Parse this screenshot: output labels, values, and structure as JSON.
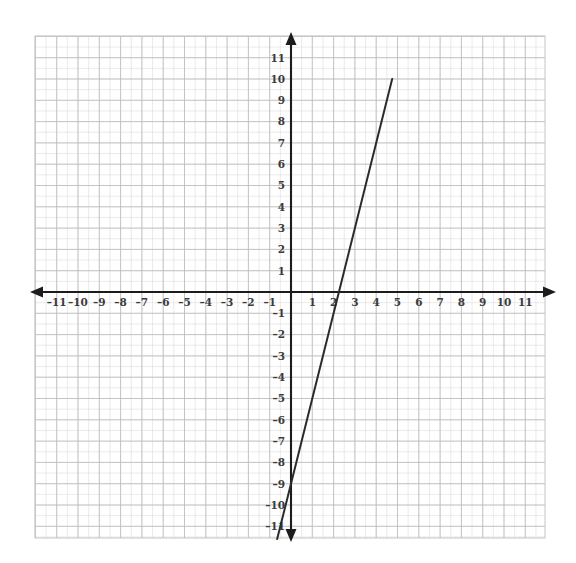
{
  "chart_data": {
    "type": "line",
    "title": "",
    "xlabel": "",
    "ylabel": "",
    "xlim": [
      -11.8,
      11.9
    ],
    "ylim": [
      -11.9,
      11.6
    ],
    "grid": true,
    "legend": false,
    "grid_minor_step": 0.5,
    "grid_major_step": 1,
    "x_ticks": [
      -11,
      -10,
      -9,
      -8,
      -7,
      -6,
      -5,
      -4,
      -3,
      -2,
      -1,
      1,
      2,
      3,
      4,
      5,
      6,
      7,
      8,
      9,
      10,
      11
    ],
    "y_ticks": [
      11,
      10,
      9,
      8,
      7,
      6,
      5,
      4,
      3,
      2,
      1,
      -1,
      -2,
      -3,
      -4,
      -5,
      -6,
      -7,
      -8,
      -9,
      -10,
      -11
    ],
    "x_tick_labels": [
      "–11",
      "–10",
      "–9",
      "–8",
      "–7",
      "–6",
      "–5",
      "–4",
      "–3",
      "–2",
      "–1",
      "1",
      "2",
      "3",
      "4",
      "5",
      "6",
      "7",
      "8",
      "9",
      "10",
      "11"
    ],
    "y_tick_labels": [
      "11",
      "10",
      "9",
      "8",
      "7",
      "6",
      "5",
      "4",
      "3",
      "2",
      "1",
      "–1",
      "–2",
      "–3",
      "–4",
      "–5",
      "–6",
      "–7",
      "–8",
      "–9",
      "–10",
      "–11"
    ],
    "series": [
      {
        "name": "line",
        "slope": 4,
        "intercept": -9,
        "x_intercept": 2.25,
        "points": [
          {
            "x": -0.65,
            "y": -11.6
          },
          {
            "x": 0,
            "y": -9
          },
          {
            "x": 2.25,
            "y": 0
          },
          {
            "x": 4.75,
            "y": 10
          }
        ],
        "color": "#2b2b2b"
      }
    ],
    "axes": {
      "x_axis_arrows": [
        "left",
        "right"
      ],
      "y_axis_arrows": [
        "up",
        "down"
      ],
      "axis_color": "#1c1c1c"
    },
    "colors": {
      "axis": "#1c1c1c",
      "line": "#2b2b2b",
      "grid_major": "#bdbdbd",
      "grid_minor": "#dcdcdc",
      "label": "#3a3a3a",
      "background": "#ffffff"
    }
  }
}
